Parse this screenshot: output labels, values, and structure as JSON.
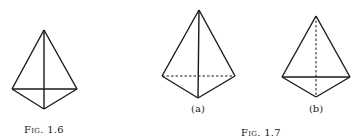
{
  "figures": [
    {
      "caption": "Fig. 1.6",
      "shape": "tetrahedron",
      "hidden_edges": "none",
      "vertices": {
        "apex": [
          44,
          30
        ],
        "left": [
          12,
          89
        ],
        "right": [
          77,
          89
        ],
        "front": [
          44,
          109
        ]
      }
    },
    {
      "caption": "Fig. 1.7",
      "subfigures": [
        {
          "label": "(a)",
          "shape": "tetrahedron",
          "hidden_edges": "left-right base edge dashed",
          "vertices": {
            "apex": [
              199,
              10
            ],
            "left": [
              162,
              76
            ],
            "right": [
              235,
              76
            ],
            "front": [
              198,
              98
            ]
          }
        },
        {
          "label": "(b)",
          "shape": "tetrahedron",
          "hidden_edges": "apex-front edge dashed",
          "vertices": {
            "apex": [
              316,
              16
            ],
            "left": [
              282,
              77
            ],
            "right": [
              350,
              77
            ],
            "front": [
              316,
              97
            ]
          }
        }
      ]
    }
  ]
}
